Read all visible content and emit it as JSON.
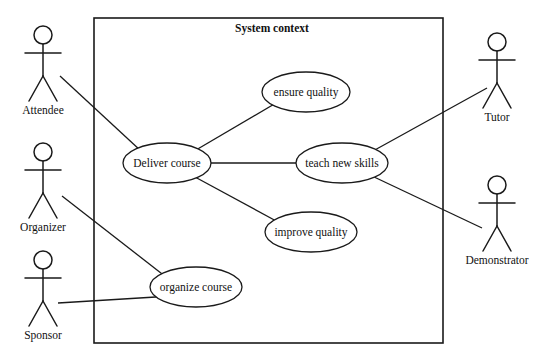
{
  "diagram": {
    "type": "uml-use-case-diagram",
    "boundary": {
      "title": "System context",
      "x": 94,
      "y": 18,
      "width": 349,
      "height": 325,
      "title_x": 272,
      "title_y": 32
    },
    "actors": [
      {
        "id": "attendee",
        "label": "Attendee",
        "cx": 43,
        "head_cy": 35,
        "label_y": 114
      },
      {
        "id": "organizer",
        "label": "Organizer",
        "cx": 43,
        "head_cy": 152,
        "label_y": 231
      },
      {
        "id": "sponsor",
        "label": "Sponsor",
        "cx": 43,
        "head_cy": 260,
        "label_y": 339
      },
      {
        "id": "tutor",
        "label": "Tutor",
        "cx": 497,
        "head_cy": 42,
        "label_y": 121
      },
      {
        "id": "demonstrator",
        "label": "Demonstrator",
        "cx": 497,
        "head_cy": 185,
        "label_y": 264
      }
    ],
    "use_cases": [
      {
        "id": "ensure-quality",
        "label": "ensure quality",
        "cx": 306,
        "cy": 92,
        "rx": 44,
        "ry": 20
      },
      {
        "id": "deliver-course",
        "label": "Deliver course",
        "cx": 167,
        "cy": 163,
        "rx": 44,
        "ry": 20
      },
      {
        "id": "teach-new-skills",
        "label": "teach new skills",
        "cx": 342,
        "cy": 163,
        "rx": 46,
        "ry": 20
      },
      {
        "id": "improve-quality",
        "label": "improve quality",
        "cx": 311,
        "cy": 232,
        "rx": 46,
        "ry": 20
      },
      {
        "id": "organize-course",
        "label": "organize course",
        "cx": 196,
        "cy": 287,
        "rx": 46,
        "ry": 20
      }
    ],
    "associations": [
      {
        "id": "attendee-deliver-course",
        "from": "attendee",
        "to": "deliver-course",
        "x1": 60,
        "y1": 76,
        "x2": 141,
        "y2": 151
      },
      {
        "id": "organizer-organize-course",
        "from": "organizer",
        "to": "organize-course",
        "x1": 62,
        "y1": 196,
        "x2": 166,
        "y2": 277
      },
      {
        "id": "sponsor-organize-course",
        "from": "sponsor",
        "to": "organize-course",
        "x1": 58,
        "y1": 303,
        "x2": 172,
        "y2": 296
      },
      {
        "id": "deliver-course-ensure-quality",
        "from": "deliver-course",
        "to": "ensure-quality",
        "x1": 196,
        "y1": 150,
        "x2": 276,
        "y2": 103
      },
      {
        "id": "deliver-course-teach-new-skills",
        "from": "deliver-course",
        "to": "teach-new-skills",
        "x1": 211,
        "y1": 163,
        "x2": 296,
        "y2": 163
      },
      {
        "id": "deliver-course-improve-quality",
        "from": "deliver-course",
        "to": "improve-quality",
        "x1": 195,
        "y1": 177,
        "x2": 278,
        "y2": 222
      },
      {
        "id": "tutor-teach-new-skills",
        "from": "tutor",
        "to": "teach-new-skills",
        "x1": 487,
        "y1": 88,
        "x2": 373,
        "y2": 151
      },
      {
        "id": "demonstrator-teach-new-skills",
        "from": "demonstrator",
        "to": "teach-new-skills",
        "x1": 482,
        "y1": 228,
        "x2": 372,
        "y2": 176
      }
    ]
  },
  "colors": {
    "stroke": "#1a1a1a",
    "text": "#111111",
    "background": "#ffffff"
  }
}
